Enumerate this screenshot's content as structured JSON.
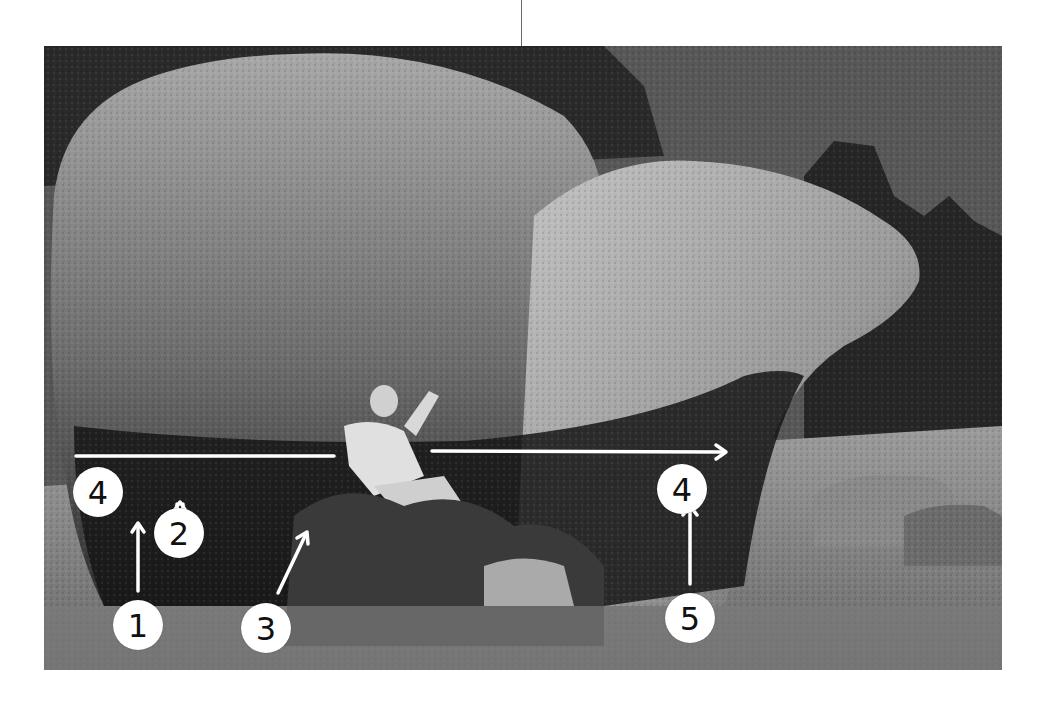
{
  "figure": {
    "colors": {
      "background": "#ffffff",
      "marker_fill": "#ffffff",
      "marker_text": "#111111",
      "arrow": "#ffffff",
      "sky": "#5a5a5a",
      "rock_light": "#b8b8b8",
      "rock_dark": "#1a1a1a"
    }
  },
  "markers": [
    {
      "id": "4-left",
      "label": "4"
    },
    {
      "id": "1",
      "label": "1"
    },
    {
      "id": "2",
      "label": "2"
    },
    {
      "id": "3",
      "label": "3"
    },
    {
      "id": "4-right",
      "label": "4"
    },
    {
      "id": "5",
      "label": "5"
    }
  ],
  "arrows": [
    {
      "route": "4",
      "kind": "traverse",
      "direction": "right"
    },
    {
      "route": "1",
      "kind": "start",
      "direction": "up"
    },
    {
      "route": "2",
      "kind": "start",
      "direction": "up"
    },
    {
      "route": "3",
      "kind": "start",
      "direction": "up-right"
    },
    {
      "route": "5",
      "kind": "start",
      "direction": "up"
    }
  ]
}
